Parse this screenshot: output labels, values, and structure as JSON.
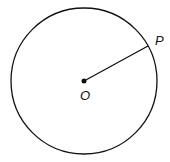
{
  "diagram": {
    "type": "circle-with-radius",
    "circle": {
      "cx": 84,
      "cy": 81,
      "r": 73,
      "stroke": "#111111"
    },
    "center": {
      "label": "O",
      "x": 84,
      "y": 81
    },
    "point": {
      "label": "P",
      "x": 148,
      "y": 47
    },
    "segments": [
      {
        "from": "O",
        "to": "P"
      }
    ]
  }
}
